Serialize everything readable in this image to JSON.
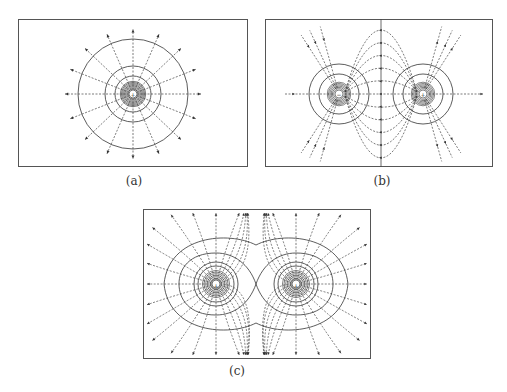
{
  "figure": {
    "panels": [
      {
        "id": "a",
        "caption": "(a)",
        "description": "Single point charge: radial field lines and concentric equipotential circles",
        "charges": [
          {
            "sign": "+",
            "label": "+"
          }
        ],
        "frame": {
          "x": 18,
          "y": 19,
          "w": 230,
          "h": 148
        },
        "caption_pos": {
          "x": 114,
          "y": 181
        }
      },
      {
        "id": "b",
        "caption": "(b)",
        "description": "Two opposite charges (dipole): field lines from positive to negative, equipotential circles, vertical midplane",
        "charges": [
          {
            "sign": "-",
            "label": "−"
          },
          {
            "sign": "+",
            "label": "+"
          }
        ],
        "frame": {
          "x": 265,
          "y": 19,
          "w": 228,
          "h": 148
        },
        "caption_pos": {
          "x": 362,
          "y": 181
        }
      },
      {
        "id": "c",
        "caption": "(c)",
        "description": "Two like positive charges: field lines repel outward, peanut-shaped equipotentials",
        "charges": [
          {
            "sign": "+",
            "label": "+"
          },
          {
            "sign": "+",
            "label": "+"
          }
        ],
        "frame": {
          "x": 143,
          "y": 209,
          "w": 228,
          "h": 150
        },
        "caption_pos": {
          "x": 237,
          "y": 370
        }
      }
    ]
  },
  "colors": {
    "line": "#3a3a3a",
    "frame": "#555555",
    "background": "#ffffff"
  }
}
